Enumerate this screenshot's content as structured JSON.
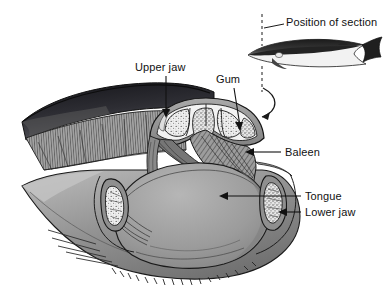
{
  "figure": {
    "background_color": "#ffffff",
    "text_color": "#111111",
    "width": 388,
    "height": 293
  },
  "labels": {
    "position_of_section": "Position of section",
    "upper_jaw": "Upper jaw",
    "gum": "Gum",
    "baleen": "Baleen",
    "tongue": "Tongue",
    "lower_jaw": "Lower jaw"
  },
  "label_positions": {
    "position_of_section": {
      "x": 286,
      "y": 22
    },
    "upper_jaw": {
      "x": 135,
      "y": 62
    },
    "gum": {
      "x": 216,
      "y": 74
    },
    "baleen": {
      "x": 283,
      "y": 147
    },
    "tongue": {
      "x": 303,
      "y": 190
    },
    "lower_jaw": {
      "x": 303,
      "y": 207
    }
  },
  "parts": {
    "whale_silhouette": "whale-body-side-view",
    "section_line": "dashed-vertical-section-line",
    "section_arrow": "curved-arrow-to-section",
    "upper_jaw_mass": "rostrum-dark-dorsal",
    "cross_section": "upper-jaw-bone-cross-section",
    "baleen_left": "baleen-plates-left",
    "baleen_right": "baleen-plates-right",
    "tongue_mass": "tongue",
    "lower_jaw_left_bone": "mandible-bone-left",
    "lower_jaw_right_bone": "mandible-bone-right",
    "throat_pleats": "ventral-throat-pleats"
  },
  "colors": {
    "outline": "#1a1a1a",
    "dark_dorsal": "#2b2b2b",
    "mid_gray": "#8c8c8c",
    "tongue_gray": "#9a9a9a",
    "light_bone": "#ededed",
    "baleen_gray": "#6f6f6f",
    "leader_line": "#1a1a1a"
  }
}
